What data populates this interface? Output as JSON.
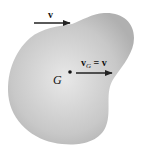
{
  "diagram": {
    "type": "rigid-body-translation",
    "body": {
      "shape": "irregular blob",
      "fill_center": "#e6e6e6",
      "fill_edge": "#b4b4b4"
    },
    "center_of_mass": {
      "label": "G",
      "dot_color": "#111111"
    },
    "vectors": [
      {
        "id": "v-top",
        "label": "v",
        "direction": "right"
      },
      {
        "id": "v-g",
        "label_main": "v",
        "label_sub": "G",
        "label_rest": " = v",
        "direction": "right"
      }
    ],
    "colors": {
      "arrow": "#222222",
      "background": "#ffffff"
    }
  }
}
